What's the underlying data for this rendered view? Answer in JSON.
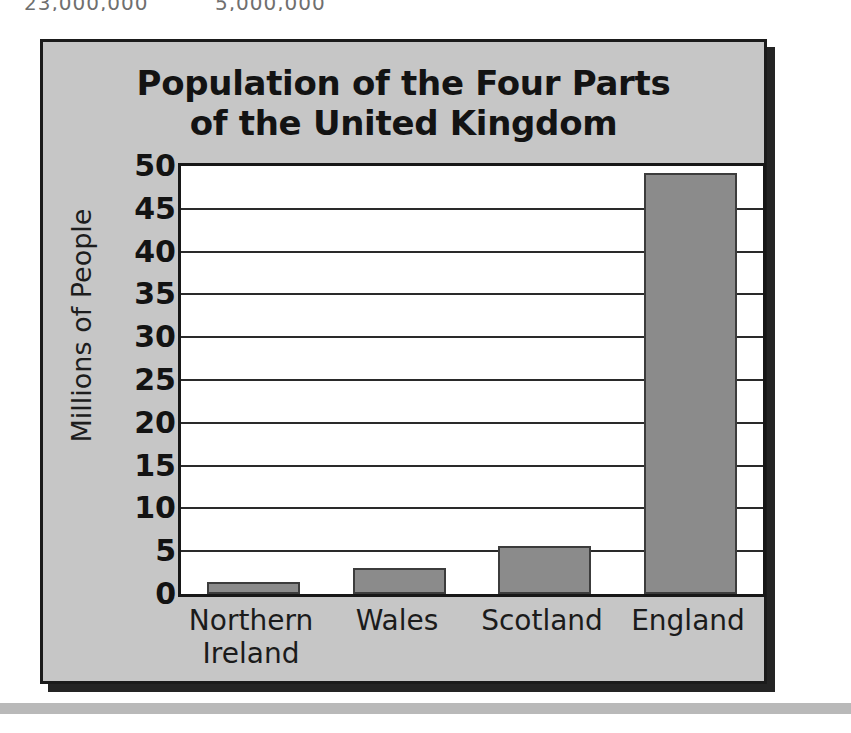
{
  "top_fragment": {
    "left_text": "23,000,000",
    "right_text": "5,000,000"
  },
  "figure": {
    "title_line1": "Population of the Four Parts",
    "title_line2": "of the United Kingdom",
    "panel_bg": "#c6c6c6",
    "border_color": "#1b1b1b",
    "bar_fill": "#8b8b8b",
    "bar_edge": "#3c3c3c",
    "plot_bg": "#ffffff"
  },
  "chart_data": {
    "type": "bar",
    "title": "Population of the Four Parts of the United Kingdom",
    "xlabel": "",
    "ylabel": "Millions of People",
    "categories": [
      "Northern Ireland",
      "Wales",
      "Scotland",
      "England"
    ],
    "values": [
      1.4,
      3.0,
      5.6,
      49.2
    ],
    "ylim": [
      0,
      50
    ],
    "ytick_values": [
      0,
      5,
      10,
      15,
      20,
      25,
      30,
      35,
      40,
      45,
      50
    ],
    "ytick_labels": [
      "0",
      "5",
      "10",
      "15",
      "20",
      "25",
      "30",
      "35",
      "40",
      "45",
      "50"
    ],
    "grid": true,
    "grid_axis": "y",
    "legend": false,
    "legend_position": "none",
    "series": [
      {
        "name": "Population",
        "values": [
          1.4,
          3.0,
          5.6,
          49.2
        ]
      }
    ]
  }
}
